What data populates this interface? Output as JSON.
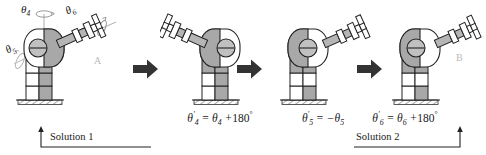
{
  "figure": {
    "type": "robot-kinematics-diagram",
    "background": "#ffffff",
    "ink": "#1a1a1a",
    "fill_gray": "#a8a8a8",
    "fill_white": "#ffffff",
    "ghost_gray": "#c9c9c9"
  },
  "panels": [
    {
      "id": "panel-1",
      "state": "Solution 1",
      "arm_direction": "upper-right",
      "shaded_side": "right",
      "caption": "",
      "point_label": "A",
      "axis_labels": [
        {
          "name": "theta4",
          "text": "θ4",
          "symbol": "θ",
          "index": "4"
        },
        {
          "name": "theta5",
          "text": "θ5",
          "symbol": "θ",
          "index": "5"
        },
        {
          "name": "theta6",
          "text": "θ6",
          "symbol": "θ",
          "index": "6"
        }
      ]
    },
    {
      "id": "panel-2",
      "state": "theta4 flipped",
      "arm_direction": "upper-left",
      "shaded_side": "left",
      "caption": "θ'4 = θ4 + 180°",
      "caption_parts": {
        "lhs_symbol": "θ",
        "lhs_index": "4",
        "rhs_symbol": "θ",
        "rhs_index": "4",
        "operator": "+",
        "value": "180",
        "unit": "°"
      },
      "point_label": ""
    },
    {
      "id": "panel-3",
      "state": "theta5 negated",
      "arm_direction": "upper-right",
      "shaded_side": "left",
      "caption": "θ'5 = −θ5",
      "caption_parts": {
        "lhs_symbol": "θ",
        "lhs_index": "5",
        "rhs_symbol": "θ",
        "rhs_index": "5",
        "operator": "−",
        "value": "",
        "unit": ""
      },
      "point_label": ""
    },
    {
      "id": "panel-4",
      "state": "Solution 2",
      "arm_direction": "upper-right",
      "shaded_side": "left",
      "caption": "θ'6 = θ6 + 180°",
      "caption_parts": {
        "lhs_symbol": "θ",
        "lhs_index": "6",
        "rhs_symbol": "θ",
        "rhs_index": "6",
        "operator": "+",
        "value": "180",
        "unit": "°"
      },
      "point_label": "B"
    }
  ],
  "labels": {
    "theta4": "θ",
    "theta4_sub": "4",
    "theta5": "θ",
    "theta5_sub": "5",
    "theta6": "θ",
    "theta6_sub": "6",
    "point_a": "A",
    "point_b": "B",
    "solution_1": "Solution 1",
    "solution_2": "Solution 2",
    "prime": "′",
    "equals": "=",
    "plus": "+",
    "minus": "−",
    "deg180": "180",
    "degree": "°"
  },
  "arrows": [
    {
      "name": "transition-arrow-1",
      "direction": "right"
    },
    {
      "name": "transition-arrow-2",
      "direction": "right"
    },
    {
      "name": "transition-arrow-3",
      "direction": "right"
    }
  ]
}
